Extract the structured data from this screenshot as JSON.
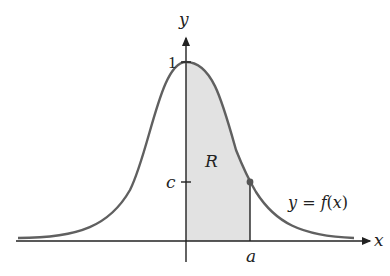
{
  "diagram": {
    "type": "function-graph",
    "axes": {
      "x_label": "x",
      "y_label": "y"
    },
    "labels": {
      "y_tick_top": "1",
      "y_tick_c": "c",
      "region": "R",
      "x_tick_a": "a",
      "curve_prefix": "y = ",
      "curve_func": "f",
      "curve_arg": "(x)"
    },
    "colors": {
      "curve": "#606060",
      "axis": "#222222",
      "shade": "#e2e2e2",
      "point": "#555555"
    }
  }
}
